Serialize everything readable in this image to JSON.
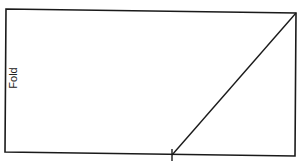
{
  "diagram": {
    "label": "Fold",
    "colors": {
      "background": "#ffffff",
      "stroke": "#1a1a1a",
      "text": "#222222"
    },
    "rectangle": {
      "top_left": [
        6,
        9
      ],
      "top_right": [
        296,
        13
      ],
      "bottom_right": [
        295,
        156
      ],
      "bottom_left": [
        5,
        152
      ]
    },
    "diagonal_line": {
      "from": [
        296,
        13
      ],
      "to": [
        172,
        155
      ]
    },
    "tick_mark": {
      "x": 172,
      "y_top": 149,
      "y_bottom": 161
    }
  }
}
